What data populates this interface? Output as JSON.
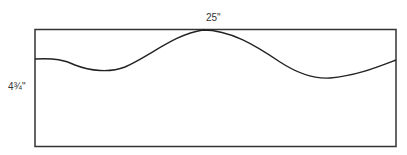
{
  "diagram": {
    "width_label": "25\"",
    "height_label": "4¾\"",
    "colors": {
      "stroke": "#333333",
      "background": "#ffffff"
    },
    "shape": "rectangle-with-wave-cut-line"
  }
}
